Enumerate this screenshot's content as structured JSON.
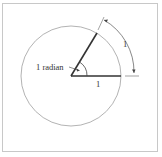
{
  "figure": {
    "angle_label": "1 radian",
    "radius_label": "1",
    "arc_label": "1",
    "colors": {
      "border": "#c8c8c8",
      "circle": "#9a9a9a",
      "radius_line": "#333333",
      "text": "#333333"
    }
  }
}
